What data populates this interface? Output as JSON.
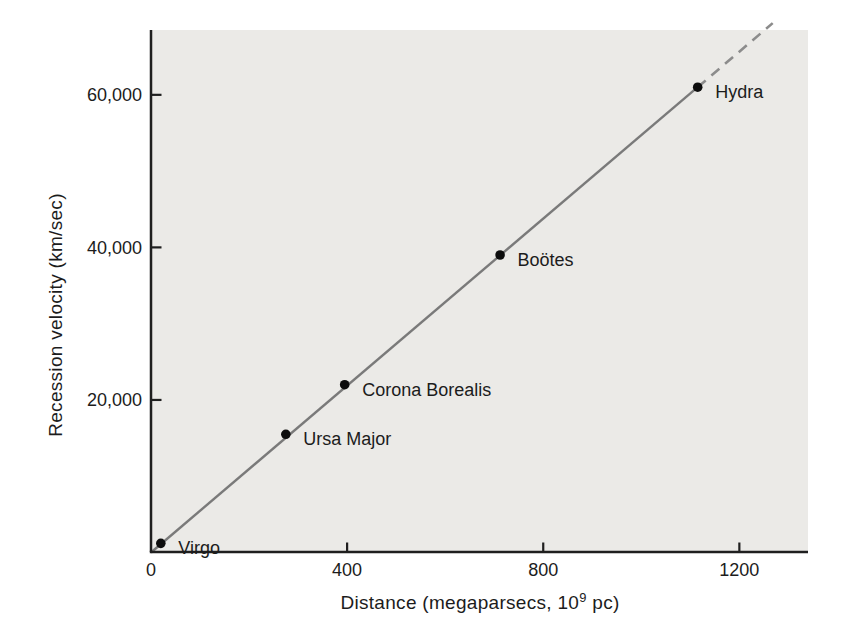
{
  "figure": {
    "background": "#ffffff",
    "plot_background": "#ebeae7",
    "axis_color": "#1f1f1f",
    "line_color": "#7a7a7a",
    "dashed_line_color": "#8c8c8c",
    "point_color": "#0d0d0d",
    "text_color": "#1c1c1c"
  },
  "chart_data": {
    "type": "scatter",
    "title": "",
    "xlabel": "Distance (megaparsecs, 10⁹ pc)",
    "xlabel_parts": {
      "prefix": "Distance (megaparsecs, 10",
      "superscript": "9",
      "suffix": " pc)"
    },
    "ylabel": "Recession velocity (km/sec)",
    "xlim": [
      0,
      1340
    ],
    "ylim": [
      0,
      68500
    ],
    "grid": false,
    "legend": false,
    "x_ticks": [
      {
        "value": 0,
        "label": "0"
      },
      {
        "value": 400,
        "label": "400"
      },
      {
        "value": 800,
        "label": "800"
      },
      {
        "value": 1200,
        "label": "1200"
      }
    ],
    "y_ticks": [
      {
        "value": 20000,
        "label": "20,000"
      },
      {
        "value": 40000,
        "label": "40,000"
      },
      {
        "value": 60000,
        "label": "60,000"
      }
    ],
    "series": [
      {
        "name": "galaxy-clusters",
        "points": [
          {
            "label": "Virgo",
            "x": 20,
            "y": 1200
          },
          {
            "label": "Ursa Major",
            "x": 275,
            "y": 15500
          },
          {
            "label": "Corona Borealis",
            "x": 395,
            "y": 22000
          },
          {
            "label": "Boötes",
            "x": 712,
            "y": 39000
          },
          {
            "label": "Hydra",
            "x": 1115,
            "y": 61000
          }
        ]
      }
    ],
    "fit_line": {
      "style": "solid",
      "from": {
        "x": 0,
        "y": 0
      },
      "to": {
        "x": 1115,
        "y": 61000
      }
    },
    "extrapolation_line": {
      "style": "dashed",
      "from": {
        "x": 1115,
        "y": 61000
      },
      "to": {
        "x": 1268,
        "y": 69400
      }
    }
  }
}
